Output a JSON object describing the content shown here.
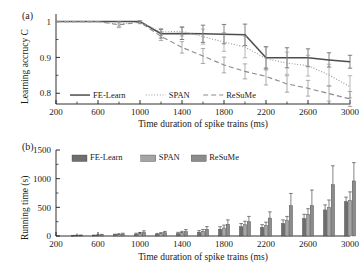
{
  "figure": {
    "background": "#ffffff",
    "ink": "#1a1a1a"
  },
  "panel_a": {
    "tag": "(a)",
    "xlabel": "Time duration of spike trains (ms)",
    "ylabel": "Learning accrucy C",
    "yticks": [
      "0.8",
      "0.9",
      "1"
    ],
    "xticks": [
      "200",
      "600",
      "1000",
      "1400",
      "1800",
      "2200",
      "2600",
      "3000"
    ],
    "legend": [
      {
        "label": "FE-Learn",
        "style": "solid",
        "color": "#4d4d4d"
      },
      {
        "label": "SPAN",
        "style": "dotted",
        "color": "#9a9a9a"
      },
      {
        "label": "ReSuMe",
        "style": "dashed",
        "color": "#8a8a8a"
      }
    ]
  },
  "panel_b": {
    "tag": "(b)",
    "xlabel": "Time duration of spike trains (ms)",
    "ylabel": "Running time (s)",
    "yticks": [
      "0",
      "500",
      "1000",
      "1500"
    ],
    "xticks": [
      "200",
      "600",
      "1000",
      "1400",
      "1800",
      "2200",
      "2600",
      "3000"
    ],
    "legend": [
      {
        "label": "FE-Learn",
        "color": "#6e6e6e"
      },
      {
        "label": "SPAN",
        "color": "#a5a5a5"
      },
      {
        "label": "ReSuMe",
        "color": "#8c8c8c"
      }
    ]
  },
  "chart_data": [
    {
      "type": "line",
      "panel": "(a)",
      "title": "",
      "xlabel": "Time duration of spike trains (ms)",
      "ylabel": "Learning accrucy C",
      "xlim": [
        200,
        3000
      ],
      "ylim": [
        0.77,
        1.01
      ],
      "xticks": [
        200,
        600,
        1000,
        1400,
        1800,
        2200,
        2600,
        3000
      ],
      "yticks": [
        0.8,
        0.9,
        1.0
      ],
      "grid": false,
      "legend_position": "bottom-left",
      "x": [
        200,
        400,
        600,
        800,
        1000,
        1200,
        1400,
        1600,
        1800,
        2000,
        2200,
        2400,
        2600,
        2800,
        3000
      ],
      "series": [
        {
          "name": "FE-Learn",
          "style": "solid",
          "color": "#4d4d4d",
          "values": [
            1.0,
            1.0,
            1.0,
            1.0,
            1.0,
            0.966,
            0.967,
            0.966,
            0.965,
            0.963,
            0.899,
            0.899,
            0.899,
            0.893,
            0.888
          ],
          "errors": [
            0.0,
            0.0,
            0.0,
            0.0,
            0.0,
            0.012,
            0.017,
            0.024,
            0.027,
            0.03,
            0.031,
            0.028,
            0.025,
            0.02,
            0.018
          ]
        },
        {
          "name": "SPAN",
          "style": "dotted",
          "color": "#9a9a9a",
          "values": [
            1.0,
            1.0,
            1.0,
            0.993,
            0.999,
            0.971,
            0.973,
            0.958,
            0.943,
            0.929,
            0.897,
            0.884,
            0.877,
            0.851,
            0.818
          ],
          "errors": [
            0.0,
            0.0,
            0.0,
            0.006,
            0.004,
            0.01,
            0.013,
            0.021,
            0.026,
            0.03,
            0.032,
            0.031,
            0.029,
            0.03,
            0.031
          ]
        },
        {
          "name": "ReSuMe",
          "style": "dashed",
          "color": "#8a8a8a",
          "values": [
            1.0,
            1.0,
            1.0,
            0.991,
            0.998,
            0.959,
            0.928,
            0.904,
            0.879,
            0.861,
            0.847,
            0.826,
            0.814,
            0.799,
            0.784
          ],
          "errors": [
            0.0,
            0.0,
            0.0,
            0.008,
            0.004,
            0.012,
            0.016,
            0.021,
            0.022,
            0.021,
            0.024,
            0.023,
            0.022,
            0.021,
            0.021
          ]
        }
      ]
    },
    {
      "type": "bar",
      "panel": "(b)",
      "title": "",
      "xlabel": "Time duration of spike trains (ms)",
      "ylabel": "Running time (s)",
      "xlim": [
        200,
        3000
      ],
      "ylim": [
        0,
        1500
      ],
      "xticks": [
        200,
        600,
        1000,
        1400,
        1800,
        2200,
        2600,
        3000
      ],
      "yticks": [
        0,
        500,
        1000,
        1500
      ],
      "grid": false,
      "legend_position": "top-left",
      "categories": [
        400,
        600,
        800,
        1000,
        1200,
        1400,
        1600,
        1800,
        2000,
        2200,
        2400,
        2600,
        2800,
        3000
      ],
      "series": [
        {
          "name": "FE-Learn",
          "color": "#6e6e6e",
          "values": [
            5,
            10,
            22,
            33,
            31,
            44,
            66,
            118,
            163,
            150,
            219,
            305,
            455,
            600
          ],
          "errors": [
            4,
            6,
            10,
            16,
            14,
            20,
            28,
            44,
            54,
            48,
            62,
            74,
            88,
            78
          ]
        },
        {
          "name": "SPAN",
          "color": "#a5a5a5",
          "values": [
            8,
            14,
            26,
            42,
            41,
            57,
            83,
            140,
            196,
            186,
            268,
            380,
            500,
            620
          ],
          "errors": [
            5,
            8,
            12,
            20,
            18,
            24,
            32,
            50,
            62,
            56,
            74,
            96,
            128,
            150
          ]
        },
        {
          "name": "ReSuMe",
          "color": "#8c8c8c",
          "values": [
            10,
            18,
            33,
            62,
            56,
            78,
            118,
            205,
            250,
            313,
            530,
            530,
            895,
            960
          ],
          "errors": [
            7,
            10,
            16,
            28,
            24,
            34,
            46,
            76,
            92,
            108,
            212,
            272,
            330,
            320
          ]
        }
      ]
    }
  ]
}
